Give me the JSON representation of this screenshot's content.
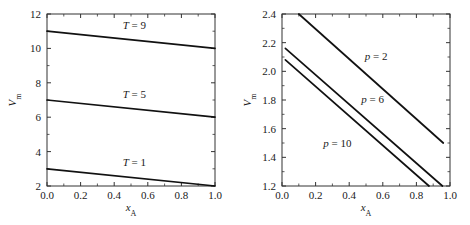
{
  "figure": {
    "background": "#ffffff",
    "line_color": "#111111",
    "axis_color": "#333333"
  },
  "chart_data": [
    {
      "panel": "left",
      "type": "line",
      "title": "",
      "xlabel": "x_A",
      "xlabel_base": "x",
      "xlabel_sub": "A",
      "ylabel": "V_m",
      "ylabel_base": "V",
      "ylabel_sub": "m",
      "xlim": [
        0.0,
        1.0
      ],
      "ylim": [
        2,
        12
      ],
      "xticks": [
        0.0,
        0.2,
        0.4,
        0.6,
        0.8,
        1.0
      ],
      "xticklabels": [
        "0.0",
        "0.2",
        "0.4",
        "0.6",
        "0.8",
        "1.0"
      ],
      "yticks": [
        2,
        4,
        6,
        8,
        10,
        12
      ],
      "yticklabels": [
        "2",
        "4",
        "6",
        "8",
        "10",
        "12"
      ],
      "grid": false,
      "legend": "inline-annotations",
      "series": [
        {
          "name": "T = 9",
          "label_base": "T",
          "label_eq": "=",
          "label_num": "9",
          "x": [
            0.0,
            1.0
          ],
          "values": [
            11.0,
            10.0
          ],
          "annotation_x": 0.52,
          "annotation_y": 11.1
        },
        {
          "name": "T = 5",
          "label_base": "T",
          "label_eq": "=",
          "label_num": "5",
          "x": [
            0.0,
            1.0
          ],
          "values": [
            7.0,
            6.0
          ],
          "annotation_x": 0.52,
          "annotation_y": 7.1
        },
        {
          "name": "T = 1",
          "label_base": "T",
          "label_eq": "=",
          "label_num": "1",
          "x": [
            0.0,
            1.0
          ],
          "values": [
            3.0,
            2.0
          ],
          "annotation_x": 0.52,
          "annotation_y": 3.15
        }
      ]
    },
    {
      "panel": "right",
      "type": "line",
      "title": "",
      "xlabel": "x_A",
      "xlabel_base": "x",
      "xlabel_sub": "A",
      "ylabel": "V_m",
      "ylabel_base": "V",
      "ylabel_sub": "m",
      "xlim": [
        0.0,
        1.0
      ],
      "ylim": [
        1.2,
        2.4
      ],
      "xticks": [
        0.0,
        0.2,
        0.4,
        0.6,
        0.8,
        1.0
      ],
      "xticklabels": [
        "0.0",
        "0.2",
        "0.4",
        "0.6",
        "0.8",
        "1.0"
      ],
      "yticks": [
        1.2,
        1.4,
        1.6,
        1.8,
        2.0,
        2.2,
        2.4
      ],
      "yticklabels": [
        "1.2",
        "1.4",
        "1.6",
        "1.8",
        "2.0",
        "2.2",
        "2.4"
      ],
      "grid": false,
      "legend": "inline-annotations",
      "series": [
        {
          "name": "p = 2",
          "label_base": "p",
          "label_eq": "=",
          "label_num": "2",
          "x": [
            0.1,
            0.96
          ],
          "values": [
            2.4,
            1.5
          ],
          "annotation_x": 0.56,
          "annotation_y": 2.08
        },
        {
          "name": "p = 6",
          "label_base": "p",
          "label_eq": "=",
          "label_num": "6",
          "x": [
            0.02,
            0.955
          ],
          "values": [
            2.16,
            1.2
          ],
          "annotation_x": 0.54,
          "annotation_y": 1.78
        },
        {
          "name": "p = 10",
          "label_base": "p",
          "label_eq": "=",
          "label_num": "10",
          "x": [
            0.02,
            0.875
          ],
          "values": [
            2.08,
            1.2
          ],
          "annotation_x": 0.33,
          "annotation_y": 1.47
        }
      ]
    }
  ]
}
